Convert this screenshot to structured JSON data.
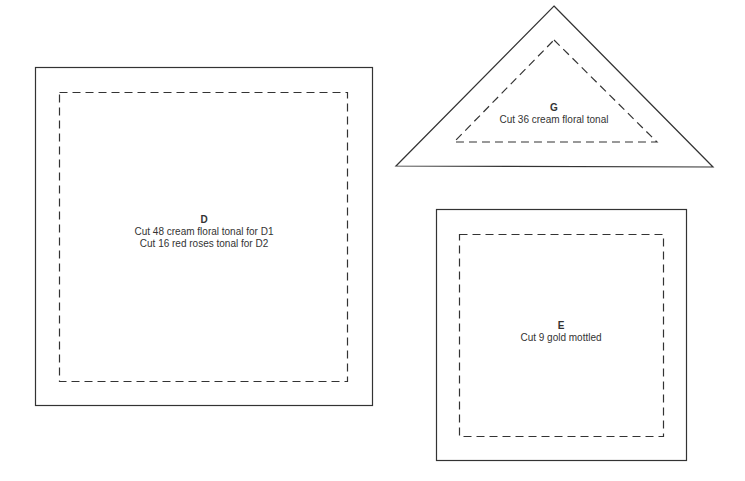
{
  "colors": {
    "stroke": "#333333",
    "text": "#333333",
    "background": "#ffffff"
  },
  "pieces": [
    {
      "id": "D",
      "shape": "square",
      "letter": "D",
      "lines": [
        "Cut 48 cream floral tonal for D1",
        "Cut 16 red roses tonal for D2"
      ]
    },
    {
      "id": "G",
      "shape": "triangle",
      "letter": "G",
      "lines": [
        "Cut 36 cream floral tonal"
      ]
    },
    {
      "id": "E",
      "shape": "square",
      "letter": "E",
      "lines": [
        "Cut 9 gold mottled"
      ]
    }
  ]
}
